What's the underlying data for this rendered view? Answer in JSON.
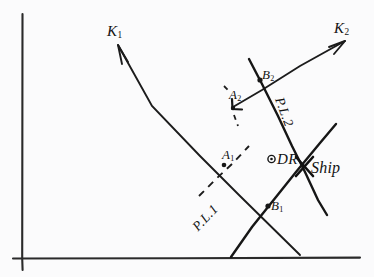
{
  "figure": {
    "background_color": "#fbfbfc",
    "ink_color": "#1c1c1c"
  },
  "axes": {
    "vertical_label": "",
    "horizontal_label": ""
  },
  "labels": {
    "k1": "K",
    "k1_sub": "1",
    "k2": "K",
    "k2_sub": "2",
    "a1": "A",
    "a1_sub": "1",
    "a2": "A",
    "a2_sub": "2",
    "b1": "B",
    "b1_sub": "1",
    "b2": "B",
    "b2_sub": "2",
    "dr": "DR",
    "ship": "Ship",
    "pl1": "P.L.1",
    "pl2": "P.L.2"
  },
  "elements": {
    "k1_ray_name": "course-line-k1",
    "k2_ray_name": "course-line-k2",
    "pl1_name": "position-line-1",
    "pl2_name": "position-line-2",
    "dr_point_name": "dead-reckoning-point",
    "ship_point_name": "ship-fix-point"
  }
}
